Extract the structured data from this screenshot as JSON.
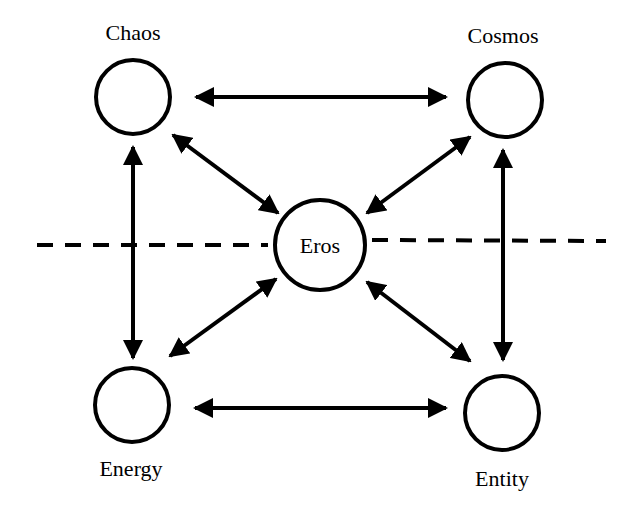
{
  "diagram": {
    "nodes": [
      {
        "id": "chaos",
        "label": "Chaos",
        "cx": 133,
        "cy": 97,
        "r": 37,
        "label_x": 133,
        "label_y": 40
      },
      {
        "id": "cosmos",
        "label": "Cosmos",
        "cx": 505,
        "cy": 100,
        "r": 37,
        "label_x": 503,
        "label_y": 43
      },
      {
        "id": "eros",
        "label": "Eros",
        "cx": 320,
        "cy": 245,
        "r": 45,
        "label_x": 320,
        "label_y": 253
      },
      {
        "id": "energy",
        "label": "Energy",
        "cx": 132,
        "cy": 405,
        "r": 37,
        "label_x": 131,
        "label_y": 476
      },
      {
        "id": "entity",
        "label": "Entity",
        "cx": 502,
        "cy": 413,
        "r": 37,
        "label_x": 502,
        "label_y": 486
      }
    ],
    "edges": [
      {
        "from": "chaos",
        "to": "cosmos",
        "bidirectional": true
      },
      {
        "from": "energy",
        "to": "entity",
        "bidirectional": true
      },
      {
        "from": "chaos",
        "to": "energy",
        "bidirectional": true
      },
      {
        "from": "cosmos",
        "to": "entity",
        "bidirectional": true
      },
      {
        "from": "chaos",
        "to": "eros",
        "bidirectional": true
      },
      {
        "from": "cosmos",
        "to": "eros",
        "bidirectional": true
      },
      {
        "from": "energy",
        "to": "eros",
        "bidirectional": true
      },
      {
        "from": "entity",
        "to": "eros",
        "bidirectional": true
      }
    ],
    "divider": {
      "style": "dashed",
      "orientation": "horizontal"
    }
  }
}
